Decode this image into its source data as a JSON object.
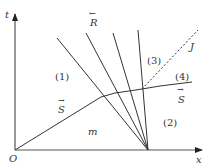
{
  "diagram": {
    "type": "wave-interaction diagram (x-t plane)",
    "axes": {
      "x_label": "x",
      "t_label": "t",
      "origin_label": "O"
    },
    "regions": [
      {
        "id": "region-1",
        "label": "(1)"
      },
      {
        "id": "region-2",
        "label": "(2)"
      },
      {
        "id": "region-3",
        "label": "(3)"
      },
      {
        "id": "region-4",
        "label": "(4)"
      },
      {
        "id": "region-m",
        "label": "m"
      }
    ],
    "waves": {
      "rarefaction_label": "R",
      "rarefaction_arrow": "←",
      "shock_label": "S",
      "shock_arrow": "→",
      "shock_label_lower": "S",
      "shock_label_right": "S",
      "contact_label": "J"
    },
    "colors": {
      "line": "#333333",
      "axis": "#555555",
      "background": "#ffffff"
    }
  }
}
